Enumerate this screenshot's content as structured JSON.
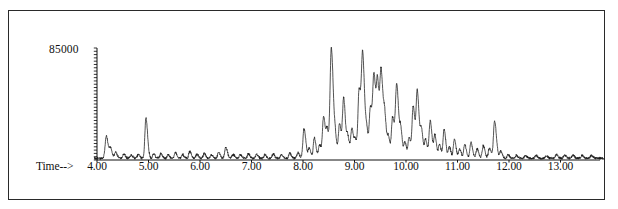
{
  "figure": {
    "kind": "gc-ms-total-ion-chromatogram",
    "background_color": "#ffffff",
    "trace_color": "#1a1a1a",
    "axis_color": "#111111",
    "frame_color": "#2a2a2a"
  },
  "axes": {
    "y_axis_label": "85000",
    "x_axis_prefix_label": "Time-->",
    "x_tick_labels": [
      "4.00",
      "5.00",
      "6.00",
      "7.00",
      "8.00",
      "9.00",
      "10.00",
      "11.00",
      "12.00",
      "13.00"
    ]
  },
  "chart_data": {
    "type": "line",
    "title": "",
    "subtitle": "",
    "xlabel": "Time-->",
    "ylabel": "85000",
    "grid": false,
    "legend": null,
    "xlim": [
      3.95,
      13.85
    ],
    "ylim": [
      0,
      100000
    ],
    "y_tick_labeled": [
      85000
    ],
    "y_minor_tick_count": 34,
    "x_ticks": [
      4.0,
      5.0,
      6.0,
      7.0,
      8.0,
      9.0,
      10.0,
      11.0,
      12.0,
      13.0
    ],
    "x_tick_labels": [
      "4.00",
      "5.00",
      "6.00",
      "7.00",
      "8.00",
      "9.00",
      "10.00",
      "11.00",
      "12.00",
      "13.00"
    ],
    "series": [
      {
        "name": "TIC",
        "baseline": 1500,
        "peaks": [
          {
            "x": 4.18,
            "height": 20000,
            "width": 0.022
          },
          {
            "x": 4.26,
            "height": 9000,
            "width": 0.02
          },
          {
            "x": 4.36,
            "height": 5200,
            "width": 0.02
          },
          {
            "x": 4.52,
            "height": 3600,
            "width": 0.018
          },
          {
            "x": 4.66,
            "height": 3000,
            "width": 0.018
          },
          {
            "x": 4.8,
            "height": 3400,
            "width": 0.018
          },
          {
            "x": 4.95,
            "height": 36000,
            "width": 0.02
          },
          {
            "x": 5.1,
            "height": 3800,
            "width": 0.018
          },
          {
            "x": 5.24,
            "height": 4200,
            "width": 0.018
          },
          {
            "x": 5.38,
            "height": 3200,
            "width": 0.018
          },
          {
            "x": 5.52,
            "height": 5000,
            "width": 0.018
          },
          {
            "x": 5.66,
            "height": 3400,
            "width": 0.018
          },
          {
            "x": 5.8,
            "height": 6200,
            "width": 0.018
          },
          {
            "x": 5.94,
            "height": 3600,
            "width": 0.018
          },
          {
            "x": 6.08,
            "height": 4400,
            "width": 0.018
          },
          {
            "x": 6.22,
            "height": 3000,
            "width": 0.018
          },
          {
            "x": 6.36,
            "height": 5400,
            "width": 0.018
          },
          {
            "x": 6.5,
            "height": 9500,
            "width": 0.02
          },
          {
            "x": 6.64,
            "height": 3600,
            "width": 0.018
          },
          {
            "x": 6.78,
            "height": 3000,
            "width": 0.018
          },
          {
            "x": 6.94,
            "height": 4200,
            "width": 0.018
          },
          {
            "x": 7.1,
            "height": 3400,
            "width": 0.018
          },
          {
            "x": 7.26,
            "height": 3000,
            "width": 0.018
          },
          {
            "x": 7.42,
            "height": 3800,
            "width": 0.018
          },
          {
            "x": 7.58,
            "height": 3200,
            "width": 0.018
          },
          {
            "x": 7.74,
            "height": 4600,
            "width": 0.018
          },
          {
            "x": 7.9,
            "height": 5000,
            "width": 0.018
          },
          {
            "x": 8.02,
            "height": 26000,
            "width": 0.022
          },
          {
            "x": 8.12,
            "height": 8500,
            "width": 0.02
          },
          {
            "x": 8.22,
            "height": 18000,
            "width": 0.02
          },
          {
            "x": 8.32,
            "height": 12000,
            "width": 0.02
          },
          {
            "x": 8.4,
            "height": 37000,
            "width": 0.022
          },
          {
            "x": 8.47,
            "height": 22000,
            "width": 0.02
          },
          {
            "x": 8.55,
            "height": 98000,
            "width": 0.024
          },
          {
            "x": 8.63,
            "height": 15000,
            "width": 0.02
          },
          {
            "x": 8.71,
            "height": 30000,
            "width": 0.022
          },
          {
            "x": 8.79,
            "height": 52000,
            "width": 0.022
          },
          {
            "x": 8.87,
            "height": 18000,
            "width": 0.02
          },
          {
            "x": 8.95,
            "height": 26000,
            "width": 0.022
          },
          {
            "x": 9.02,
            "height": 14000,
            "width": 0.02
          },
          {
            "x": 9.09,
            "height": 60000,
            "width": 0.022
          },
          {
            "x": 9.16,
            "height": 87000,
            "width": 0.024
          },
          {
            "x": 9.24,
            "height": 20000,
            "width": 0.02
          },
          {
            "x": 9.31,
            "height": 44000,
            "width": 0.022
          },
          {
            "x": 9.38,
            "height": 70000,
            "width": 0.024
          },
          {
            "x": 9.45,
            "height": 58000,
            "width": 0.022
          },
          {
            "x": 9.52,
            "height": 72000,
            "width": 0.024
          },
          {
            "x": 9.59,
            "height": 30000,
            "width": 0.022
          },
          {
            "x": 9.66,
            "height": 16000,
            "width": 0.02
          },
          {
            "x": 9.74,
            "height": 36000,
            "width": 0.022
          },
          {
            "x": 9.82,
            "height": 64000,
            "width": 0.024
          },
          {
            "x": 9.9,
            "height": 22000,
            "width": 0.02
          },
          {
            "x": 9.98,
            "height": 14000,
            "width": 0.02
          },
          {
            "x": 10.06,
            "height": 18000,
            "width": 0.02
          },
          {
            "x": 10.14,
            "height": 46000,
            "width": 0.022
          },
          {
            "x": 10.22,
            "height": 58000,
            "width": 0.022
          },
          {
            "x": 10.3,
            "height": 24000,
            "width": 0.02
          },
          {
            "x": 10.38,
            "height": 16000,
            "width": 0.02
          },
          {
            "x": 10.47,
            "height": 33000,
            "width": 0.022
          },
          {
            "x": 10.56,
            "height": 20000,
            "width": 0.02
          },
          {
            "x": 10.65,
            "height": 12000,
            "width": 0.02
          },
          {
            "x": 10.74,
            "height": 26000,
            "width": 0.02
          },
          {
            "x": 10.84,
            "height": 10000,
            "width": 0.02
          },
          {
            "x": 10.94,
            "height": 17000,
            "width": 0.02
          },
          {
            "x": 11.04,
            "height": 8000,
            "width": 0.02
          },
          {
            "x": 11.14,
            "height": 12000,
            "width": 0.02
          },
          {
            "x": 11.26,
            "height": 14000,
            "width": 0.02
          },
          {
            "x": 11.38,
            "height": 8500,
            "width": 0.02
          },
          {
            "x": 11.5,
            "height": 11000,
            "width": 0.02
          },
          {
            "x": 11.62,
            "height": 9000,
            "width": 0.02
          },
          {
            "x": 11.72,
            "height": 33000,
            "width": 0.022
          },
          {
            "x": 11.84,
            "height": 6000,
            "width": 0.02
          },
          {
            "x": 11.98,
            "height": 3200,
            "width": 0.018
          },
          {
            "x": 12.14,
            "height": 2600,
            "width": 0.018
          },
          {
            "x": 12.32,
            "height": 2400,
            "width": 0.018
          },
          {
            "x": 12.52,
            "height": 2600,
            "width": 0.018
          },
          {
            "x": 12.72,
            "height": 2400,
            "width": 0.018
          },
          {
            "x": 12.92,
            "height": 3400,
            "width": 0.018
          },
          {
            "x": 13.08,
            "height": 3000,
            "width": 0.018
          },
          {
            "x": 13.24,
            "height": 2800,
            "width": 0.018
          },
          {
            "x": 13.42,
            "height": 2600,
            "width": 0.018
          },
          {
            "x": 13.6,
            "height": 2400,
            "width": 0.018
          }
        ]
      }
    ]
  }
}
